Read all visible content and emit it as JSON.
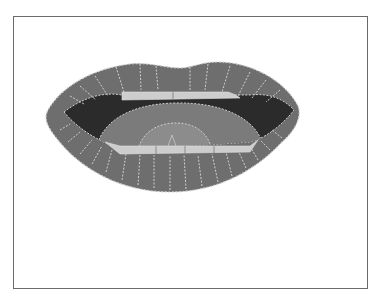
{
  "image": {
    "subject": "lips illustration",
    "description": "Grayscale cartoon of open lips showing upper and lower teeth, tongue and dark mouth interior",
    "frame": {
      "border_color": "#6a6a6a",
      "background": "#ffffff"
    },
    "colors": {
      "lip": "#6e6e6e",
      "lip_stitch": "#cfcfcf",
      "mouth_interior": "#2b2b2b",
      "tongue": "#7b7b7b",
      "tongue_tip": "#8c8c8c",
      "teeth": "#cdcdcd"
    }
  }
}
